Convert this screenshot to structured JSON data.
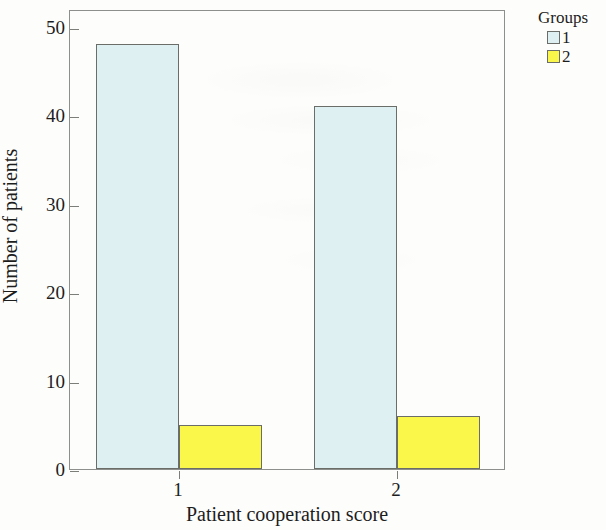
{
  "chart_data": {
    "type": "bar",
    "title": "",
    "subtitle": "",
    "xlabel": "Patient cooperation score",
    "ylabel": "Number of patients",
    "categories": [
      "1",
      "2"
    ],
    "series": [
      {
        "name": "1",
        "values": [
          48,
          41
        ]
      },
      {
        "name": "2",
        "values": [
          5,
          6
        ]
      }
    ],
    "ylim": [
      0,
      52
    ],
    "yticks": [
      0,
      10,
      20,
      30,
      40,
      50
    ],
    "ytick_labels": [
      "0",
      "10",
      "20",
      "30",
      "40",
      "50"
    ],
    "xtick_labels": [
      "1",
      "2"
    ],
    "grid": false,
    "legend": {
      "title": "Groups",
      "position": "top-right",
      "entries": [
        {
          "label": "1",
          "color": "#dff0f2"
        },
        {
          "label": "2",
          "color": "#faf64a"
        }
      ]
    },
    "colors": {
      "series_1": "#dff0f2",
      "series_2": "#faf64a",
      "bar_outline": "#6b6d68",
      "axis": "#8d8f8c",
      "text": "#1d1d1d",
      "background": "#fdfdfc"
    }
  }
}
